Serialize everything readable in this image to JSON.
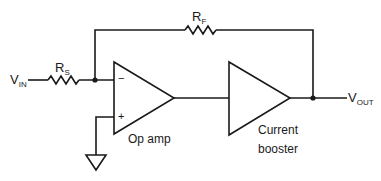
{
  "diagram": {
    "type": "circuit-schematic",
    "labels": {
      "vin_main": "V",
      "vin_sub": "IN",
      "vout_main": "V",
      "vout_sub": "OUT",
      "rs_main": "R",
      "rs_sub": "S",
      "rf_main": "R",
      "rf_sub": "F",
      "opamp_minus": "−",
      "opamp_plus": "+",
      "opamp_caption": "Op amp",
      "booster_caption_line1": "Current",
      "booster_caption_line2": "booster"
    },
    "components": [
      {
        "id": "RS",
        "kind": "resistor",
        "label": "R_S"
      },
      {
        "id": "RF",
        "kind": "resistor",
        "label": "R_F"
      },
      {
        "id": "opamp",
        "kind": "op-amp",
        "label": "Op amp"
      },
      {
        "id": "booster",
        "kind": "buffer-amplifier",
        "label": "Current booster"
      },
      {
        "id": "gnd",
        "kind": "ground"
      }
    ],
    "connections": [
      [
        "VIN",
        "RS"
      ],
      [
        "RS",
        "opamp.inverting"
      ],
      [
        "opamp.inverting",
        "RF"
      ],
      [
        "RF",
        "VOUT"
      ],
      [
        "opamp.noninverting",
        "gnd"
      ],
      [
        "opamp.output",
        "booster.input"
      ],
      [
        "booster.output",
        "VOUT"
      ]
    ],
    "colors": {
      "line": "#1a1a1a",
      "background": "#ffffff"
    }
  }
}
